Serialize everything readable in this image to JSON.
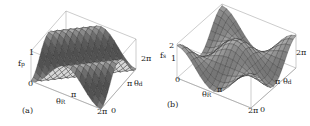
{
  "chart_data": [
    {
      "type": "surface3d",
      "panel_label": "(a)",
      "zlabel": "f",
      "zlabel_sub": "p",
      "xlabel": "θ",
      "xlabel_sub": "R",
      "ylabel": "θ",
      "ylabel_sub": "d",
      "z_ticks": [
        "0",
        "1"
      ],
      "x_ticks": [
        "0",
        "π",
        "2π"
      ],
      "y_ticks": [
        "0",
        "π",
        "2π"
      ],
      "zlim": [
        0,
        1
      ],
      "xlim": [
        0,
        6.283
      ],
      "ylim": [
        0,
        6.283
      ],
      "function": "saddle-like wave, peaks near (0,2π) and (2π,0) corners region; min 0 max 1",
      "grid": false
    },
    {
      "type": "surface3d",
      "panel_label": "(b)",
      "zlabel": "f",
      "zlabel_sub": "s",
      "xlabel": "θ",
      "xlabel_sub": "R",
      "ylabel": "θ",
      "ylabel_sub": "d",
      "z_ticks": [
        "0",
        "1",
        "2"
      ],
      "x_ticks": [
        "π",
        "2π"
      ],
      "y_ticks": [
        "0",
        "π",
        "2π"
      ],
      "zlim": [
        0,
        2
      ],
      "xlim": [
        0,
        6.283
      ],
      "ylim": [
        0,
        6.283
      ],
      "function": "wave surface with diagonal trough, range 0 to 2",
      "grid": false
    }
  ],
  "panels": {
    "a": {
      "label": "(a)",
      "z_axis": "f",
      "z_sub": "p",
      "z_top": "1",
      "z_bottom": "0",
      "x_axis": "θ",
      "x_sub": "R",
      "x_mid": "π",
      "x_end": "2π",
      "y_axis": "θ",
      "y_sub": "d",
      "y_start": "0",
      "y_mid": "π",
      "y_end": "2π"
    },
    "b": {
      "label": "(b)",
      "z_axis": "f",
      "z_sub": "s",
      "z_top": "2",
      "z_mid": "1",
      "z_bottom": "0",
      "x_axis": "θ",
      "x_sub": "R",
      "x_mid": "π",
      "x_end": "2π",
      "y_axis": "θ",
      "y_sub": "d",
      "y_start": "0",
      "y_mid": "π",
      "y_end": "2π"
    }
  }
}
